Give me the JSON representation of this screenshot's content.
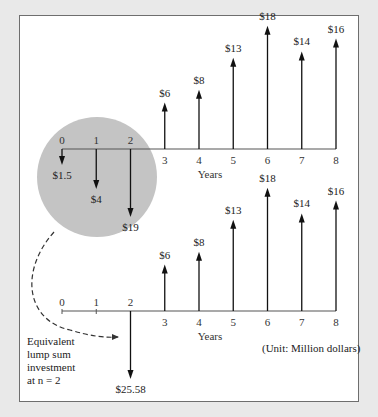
{
  "diagram": {
    "top": {
      "x_labels": [
        "0",
        "1",
        "2",
        "3",
        "4",
        "5",
        "6",
        "7",
        "8"
      ],
      "x_title": "Years",
      "cash_flows": [
        {
          "year": 0,
          "label": "$1.5",
          "value": -1.5
        },
        {
          "year": 1,
          "label": "$4",
          "value": -4
        },
        {
          "year": 2,
          "label": "$19",
          "value": -19
        },
        {
          "year": 3,
          "label": "$6",
          "value": 6
        },
        {
          "year": 4,
          "label": "$8",
          "value": 8
        },
        {
          "year": 5,
          "label": "$13",
          "value": 13
        },
        {
          "year": 6,
          "label": "$18",
          "value": 18
        },
        {
          "year": 7,
          "label": "$14",
          "value": 14
        },
        {
          "year": 8,
          "label": "$16",
          "value": 16
        }
      ]
    },
    "bottom": {
      "x_labels": [
        "0",
        "1",
        "2",
        "3",
        "4",
        "5",
        "6",
        "7",
        "8"
      ],
      "x_title": "Years",
      "cash_flows": [
        {
          "year": 2,
          "label": "$25.58",
          "value": -25.58
        },
        {
          "year": 3,
          "label": "$6",
          "value": 6
        },
        {
          "year": 4,
          "label": "$8",
          "value": 8
        },
        {
          "year": 5,
          "label": "$13",
          "value": 13
        },
        {
          "year": 6,
          "label": "$18",
          "value": 18
        },
        {
          "year": 7,
          "label": "$14",
          "value": 14
        },
        {
          "year": 8,
          "label": "$16",
          "value": 16
        }
      ],
      "annotation_lines": [
        "Equivalent",
        "lump sum",
        "investment",
        "at n = 2"
      ],
      "unit_note": "(Unit: Million dollars)"
    },
    "colors": {
      "circle": "#c4c4c4",
      "line": "#111111",
      "frame_bg": "#e9e9e9"
    }
  }
}
